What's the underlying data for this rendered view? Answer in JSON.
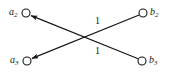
{
  "diagram": {
    "type": "bipartite-directed-graph",
    "background_color": "#ffffff",
    "stroke_color": "#161616",
    "text_color": "#161616",
    "nodes": [
      {
        "id": "a2",
        "base": "a",
        "subscript": "2",
        "label": "a2",
        "side": "left",
        "cx": 26,
        "cy": 13,
        "r": 4,
        "label_x": 9,
        "label_y": 7
      },
      {
        "id": "a3",
        "base": "a",
        "subscript": "3",
        "label": "a3",
        "side": "left",
        "cx": 27,
        "cy": 61,
        "r": 4,
        "label_x": 10,
        "label_y": 55
      },
      {
        "id": "b2",
        "base": "b",
        "subscript": "2",
        "label": "b2",
        "side": "right",
        "cx": 143,
        "cy": 13,
        "r": 4,
        "label_x": 150,
        "label_y": 7
      },
      {
        "id": "b3",
        "base": "b",
        "subscript": "3",
        "label": "b3",
        "side": "right",
        "cx": 142,
        "cy": 61,
        "r": 4,
        "label_x": 149,
        "label_y": 55
      }
    ],
    "edges": [
      {
        "id": "edge-b3-a2",
        "from": "b3",
        "to": "a2",
        "weight": "1",
        "arrow_at": "a2",
        "weight_x": 95,
        "weight_y": 16
      },
      {
        "id": "edge-b2-a3",
        "from": "b2",
        "to": "a3",
        "weight": "1",
        "arrow_at": "a3",
        "weight_x": 95,
        "weight_y": 46
      }
    ]
  }
}
